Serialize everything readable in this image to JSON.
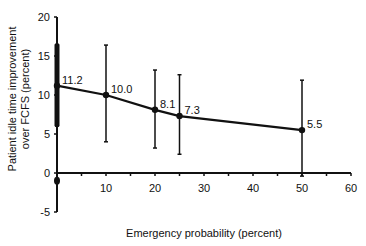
{
  "chart_data": {
    "type": "line",
    "title": "",
    "xlabel": "Emergency probability (percent)",
    "ylabel_lines": [
      "Patient idle time improvement",
      "over FCFS (percent)"
    ],
    "ylabel": "Patient idle time improvement over FCFS (percent)",
    "xlim": [
      0,
      60
    ],
    "ylim": [
      -5,
      20
    ],
    "x_ticks": [
      10,
      20,
      30,
      40,
      50,
      60
    ],
    "y_ticks": [
      -5,
      0,
      5,
      10,
      15,
      20
    ],
    "grid": false,
    "legend": null,
    "series": [
      {
        "name": "Patient idle time improvement",
        "x": [
          0,
          10,
          20,
          25,
          50
        ],
        "values": [
          11.2,
          10.0,
          8.1,
          7.3,
          5.5
        ],
        "labels": [
          "11.2",
          "10.0",
          "8.1",
          "7.3",
          "5.5"
        ],
        "error_upper": [
          16.5,
          16.4,
          13.2,
          12.6,
          11.9
        ],
        "error_lower": [
          6.0,
          4.0,
          3.2,
          2.4,
          -0.4
        ]
      }
    ],
    "color": "#111111"
  }
}
